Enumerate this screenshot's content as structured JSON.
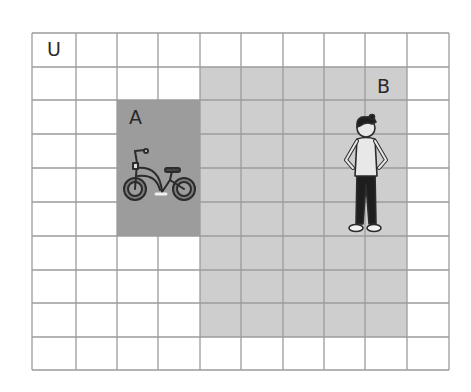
{
  "diagram": {
    "type": "venn-grid",
    "grid": {
      "columns": 10,
      "rows": 10,
      "x_lines": [
        32,
        76,
        117,
        158,
        200,
        241,
        283,
        324,
        365,
        407,
        449
      ],
      "y_lines": [
        33,
        67,
        100,
        134,
        168,
        202,
        236,
        270,
        303,
        337,
        370
      ],
      "line_color": "#9b9b9b",
      "background": "#ffffff"
    },
    "universe": {
      "label": "U"
    },
    "sets": [
      {
        "id": "A",
        "label": "A",
        "col_start": 2,
        "col_end": 4,
        "row_start": 2,
        "row_end": 6,
        "color": "#9c9c9c",
        "icon": "bicycle-icon"
      },
      {
        "id": "B",
        "label": "B",
        "col_start": 4,
        "col_end": 9,
        "row_start": 1,
        "row_end": 9,
        "color": "#cecece",
        "icon": "person-icon"
      }
    ]
  }
}
